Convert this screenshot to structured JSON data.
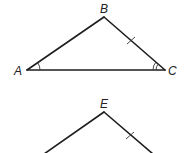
{
  "diagram": {
    "type": "geometry-triangles",
    "stroke_color": "#1e1e1e",
    "triangle_top": {
      "name": "triangle ABC",
      "vertices": {
        "A": {
          "label": "A",
          "x": 27,
          "y": 70
        },
        "B": {
          "label": "B",
          "x": 104,
          "y": 17
        },
        "C": {
          "label": "C",
          "x": 165,
          "y": 70
        }
      },
      "markings": {
        "angle_A": "single arc",
        "angle_C": "double arc",
        "side_BC": "single tick"
      }
    },
    "triangle_bottom": {
      "name": "partial triangle with apex E",
      "vertices": {
        "E": {
          "label": "E",
          "x": 104,
          "y": 112
        }
      },
      "markings": {
        "right_side": "single tick"
      }
    }
  }
}
